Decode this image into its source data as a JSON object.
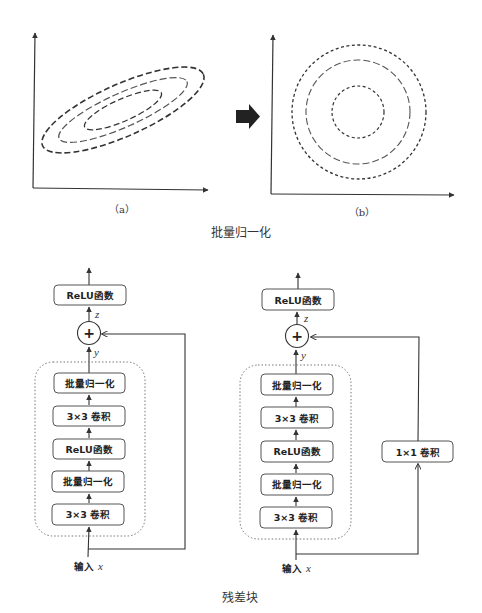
{
  "top_figure": {
    "plot_a": {
      "label": "（a）",
      "shape": "concentric tilted ellipses (correlated features)"
    },
    "plot_b": {
      "label": "（b）",
      "shape": "concentric circles (normalized features)"
    },
    "transition_icon": "right-arrow-icon",
    "caption": "批量归一化"
  },
  "bottom_figure": {
    "caption": "残差块",
    "left_block": {
      "output_box": "ReLU函数",
      "sum_symbol": "+",
      "z_label": "z",
      "y_label": "y",
      "layers": [
        "批量归一化",
        "3×3 卷积",
        "ReLU函数",
        "批量归一化",
        "3×3 卷积"
      ],
      "input_label": "输入",
      "input_var": "x",
      "shortcut": "identity"
    },
    "right_block": {
      "output_box": "ReLU函数",
      "sum_symbol": "+",
      "z_label": "z",
      "y_label": "y",
      "layers": [
        "批量归一化",
        "3×3 卷积",
        "ReLU函数",
        "批量归一化",
        "3×3 卷积"
      ],
      "shortcut_box": "1×1 卷积",
      "input_label": "输入",
      "input_var": "x",
      "shortcut": "1x1 convolution"
    }
  },
  "colors": {
    "line": "#333333",
    "box_border": "#555555",
    "dotted_border": "#777777",
    "text": "#222222"
  }
}
